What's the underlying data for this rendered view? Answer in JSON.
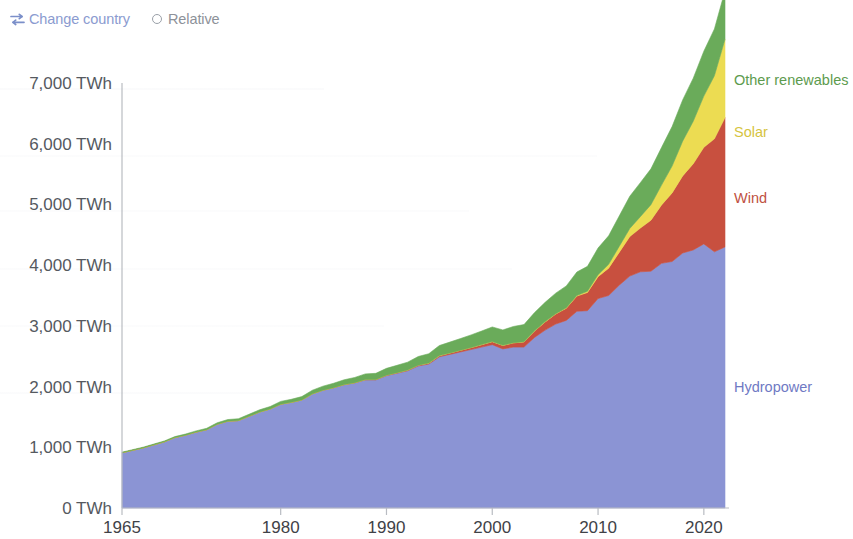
{
  "controls": {
    "change_country": {
      "label": "Change country",
      "icon": "swap-horizontal-icon",
      "color": "#8b9bd0"
    },
    "relative": {
      "label": "Relative",
      "icon": "radio-circle-icon",
      "selected": false,
      "color": "#8d9199"
    }
  },
  "chart_data": {
    "type": "area",
    "title": "",
    "subtitle": "",
    "xlabel": "",
    "ylabel": "",
    "stacked": true,
    "grid": false,
    "legend_position": "right-inline",
    "xlim": [
      1965,
      2022
    ],
    "ylim": [
      0,
      7000
    ],
    "unit": "TWh",
    "x_tick_labels": [
      "1965",
      "1980",
      "1990",
      "2000",
      "2010",
      "2020"
    ],
    "x_ticks": [
      1965,
      1980,
      1990,
      2000,
      2010,
      2020
    ],
    "y_tick_labels": [
      "0 TWh",
      "1,000 TWh",
      "2,000 TWh",
      "3,000 TWh",
      "4,000 TWh",
      "5,000 TWh",
      "6,000 TWh",
      "7,000 TWh"
    ],
    "y_ticks": [
      0,
      1000,
      2000,
      3000,
      4000,
      5000,
      6000,
      7000
    ],
    "x": [
      1965,
      1966,
      1967,
      1968,
      1969,
      1970,
      1971,
      1972,
      1973,
      1974,
      1975,
      1976,
      1977,
      1978,
      1979,
      1980,
      1981,
      1982,
      1983,
      1984,
      1985,
      1986,
      1987,
      1988,
      1989,
      1990,
      1991,
      1992,
      1993,
      1994,
      1995,
      1996,
      1997,
      1998,
      1999,
      2000,
      2001,
      2002,
      2003,
      2004,
      2005,
      2006,
      2007,
      2008,
      2009,
      2010,
      2011,
      2012,
      2013,
      2014,
      2015,
      2016,
      2017,
      2018,
      2019,
      2020,
      2021,
      2022
    ],
    "series": [
      {
        "name": "Hydropower",
        "color": "#8b94d4",
        "label_color": "#6f7ac4",
        "label_value_y": 2000,
        "values": [
          910,
          950,
          990,
          1040,
          1090,
          1160,
          1200,
          1250,
          1290,
          1380,
          1430,
          1440,
          1510,
          1580,
          1630,
          1710,
          1740,
          1780,
          1880,
          1940,
          1980,
          2030,
          2060,
          2110,
          2110,
          2180,
          2220,
          2260,
          2340,
          2370,
          2490,
          2530,
          2570,
          2610,
          2650,
          2690,
          2620,
          2650,
          2650,
          2810,
          2930,
          3030,
          3090,
          3240,
          3250,
          3450,
          3500,
          3670,
          3820,
          3890,
          3900,
          4030,
          4060,
          4200,
          4250,
          4350,
          4220,
          4300
        ]
      },
      {
        "name": "Wind",
        "color": "#c8503f",
        "label_color": "#c0513f",
        "label_value_y": 5100,
        "values": [
          0,
          0,
          0,
          0,
          0,
          0,
          0,
          0,
          0,
          0,
          0,
          0,
          0,
          0,
          0,
          0,
          0,
          0,
          0,
          1,
          2,
          3,
          4,
          5,
          6,
          8,
          9,
          11,
          13,
          16,
          19,
          23,
          27,
          32,
          40,
          50,
          57,
          70,
          85,
          105,
          135,
          165,
          200,
          250,
          300,
          360,
          450,
          540,
          650,
          720,
          840,
          960,
          1130,
          1270,
          1420,
          1590,
          1860,
          2130
        ]
      },
      {
        "name": "Solar",
        "color": "#ecdc52",
        "label_color": "#d6c43f",
        "label_value_y": 6200,
        "values": [
          0,
          0,
          0,
          0,
          0,
          0,
          0,
          0,
          0,
          0,
          0,
          0,
          0,
          0,
          0,
          0,
          0,
          0,
          0,
          0,
          0,
          0,
          0,
          0,
          0,
          0,
          0,
          0,
          0,
          1,
          1,
          1,
          1,
          1,
          1,
          1,
          2,
          2,
          3,
          4,
          5,
          6,
          8,
          12,
          20,
          32,
          63,
          99,
          134,
          189,
          256,
          328,
          443,
          572,
          700,
          844,
          1040,
          1290
        ]
      },
      {
        "name": "Other renewables",
        "color": "#6aab5a",
        "label_color": "#5d9b4e",
        "label_value_y": 7050,
        "values": [
          10,
          11,
          12,
          13,
          14,
          16,
          18,
          20,
          22,
          24,
          27,
          30,
          33,
          37,
          41,
          46,
          50,
          55,
          60,
          66,
          72,
          79,
          86,
          94,
          102,
          112,
          121,
          131,
          142,
          154,
          166,
          179,
          193,
          208,
          224,
          241,
          254,
          268,
          283,
          300,
          318,
          338,
          360,
          385,
          410,
          440,
          470,
          500,
          530,
          560,
          590,
          620,
          650,
          680,
          710,
          740,
          770,
          800
        ]
      }
    ],
    "series_labels": [
      {
        "name": "Other renewables",
        "color": "#5d9b4e"
      },
      {
        "name": "Solar",
        "color": "#d6c43f"
      },
      {
        "name": "Wind",
        "color": "#c0513f"
      },
      {
        "name": "Hydropower",
        "color": "#6f7ac4"
      }
    ]
  }
}
